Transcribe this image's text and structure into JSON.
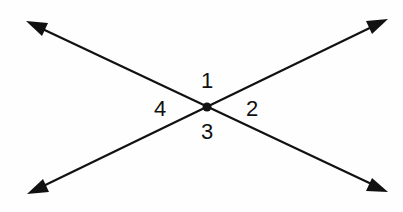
{
  "diagram": {
    "colors": {
      "line": "#111111",
      "background": "#fefefe"
    },
    "intersection": {
      "x": 207,
      "y": 107
    },
    "lines": [
      {
        "name": "line-a",
        "from": {
          "x": 26,
          "y": 21
        },
        "to": {
          "x": 388,
          "y": 192
        }
      },
      {
        "name": "line-b",
        "from": {
          "x": 27,
          "y": 194
        },
        "to": {
          "x": 388,
          "y": 19
        }
      }
    ],
    "angles": [
      {
        "label": "1",
        "x": 207,
        "y": 81,
        "position": "top"
      },
      {
        "label": "2",
        "x": 252,
        "y": 109,
        "position": "right"
      },
      {
        "label": "3",
        "x": 207,
        "y": 132,
        "position": "bottom"
      },
      {
        "label": "4",
        "x": 160,
        "y": 109,
        "position": "left"
      }
    ]
  }
}
